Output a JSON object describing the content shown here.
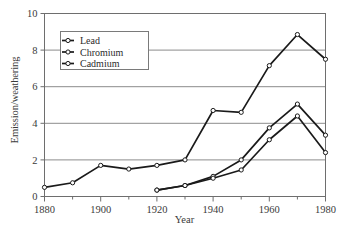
{
  "chart_data": {
    "type": "line",
    "title": "",
    "xlabel": "Year",
    "ylabel": "Emission/weathering",
    "xlim": [
      1880,
      1980
    ],
    "ylim": [
      0,
      10
    ],
    "xticks": [
      1880,
      1900,
      1920,
      1940,
      1960,
      1980
    ],
    "xtick_labels": [
      "1880",
      "1900",
      "1920",
      "1940",
      "1960",
      "1980"
    ],
    "xminorticks": [
      1890,
      1910,
      1930,
      1950,
      1970
    ],
    "yticks": [
      0,
      2,
      4,
      6,
      8,
      10
    ],
    "ytick_labels": [
      "0",
      "2",
      "4",
      "6",
      "8",
      "10"
    ],
    "grid": "horizontal",
    "legend_position": "upper-left-inside",
    "marker": "open-circle",
    "line_color": "#1a1a1a",
    "grid_color": "#8c8c8c",
    "axis_color": "#6e6e6e",
    "series": [
      {
        "name": "Lead",
        "x": [
          1880,
          1890,
          1900,
          1910,
          1920,
          1930,
          1940,
          1950,
          1960,
          1970,
          1980
        ],
        "values": [
          0.5,
          0.75,
          1.7,
          1.5,
          1.7,
          2.0,
          4.7,
          4.6,
          7.15,
          8.85,
          7.5
        ]
      },
      {
        "name": "Chromium",
        "x": [
          1920,
          1930,
          1940,
          1950,
          1960,
          1970,
          1980
        ],
        "values": [
          0.35,
          0.6,
          1.1,
          2.0,
          3.75,
          5.05,
          3.35
        ]
      },
      {
        "name": "Cadmium",
        "x": [
          1920,
          1930,
          1940,
          1950,
          1960,
          1970,
          1980
        ],
        "values": [
          0.35,
          0.6,
          1.0,
          1.45,
          3.1,
          4.4,
          2.4
        ]
      }
    ]
  },
  "legend": {
    "items": [
      {
        "label": "Lead"
      },
      {
        "label": "Chromium"
      },
      {
        "label": "Cadmium"
      }
    ]
  }
}
